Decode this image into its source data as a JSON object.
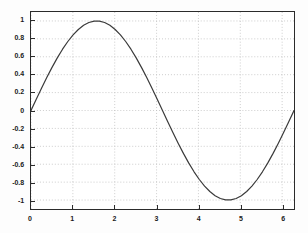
{
  "figure": {
    "background_color": "#fdfdfd",
    "axes_background_color": "#ffffff",
    "axes_border_color": "#2b2b2b",
    "grid_color": "#bfbfbf",
    "line_color": "#3a3a3a",
    "tick_label_color": "#1a1a1a"
  },
  "chart_data": {
    "type": "line",
    "title": "",
    "subtitle": "",
    "xlabel": "",
    "ylabel": "",
    "xlim": [
      0,
      6.2832
    ],
    "ylim": [
      -1.1,
      1.1
    ],
    "grid": true,
    "grid_style": "dotted",
    "legend": null,
    "legend_position": "none",
    "xticks": [
      0,
      1,
      2,
      3,
      4,
      5,
      6
    ],
    "xtick_labels": [
      "0",
      "1",
      "2",
      "3",
      "4",
      "5",
      "6"
    ],
    "yticks": [
      1,
      0.8,
      0.6,
      0.4,
      0.2,
      0,
      -0.2,
      -0.4,
      -0.6,
      -0.8,
      -1
    ],
    "ytick_labels": [
      "1",
      "0.8",
      "0.6",
      "0.4",
      "0.2",
      "0",
      "-0.2",
      "-0.4",
      "-0.6",
      "-0.8",
      "-1"
    ],
    "series": [
      {
        "name": "sin(x)",
        "color": "#3a3a3a",
        "line_width": 1.2,
        "x": [
          0,
          0.1257,
          0.2513,
          0.377,
          0.5027,
          0.6283,
          0.754,
          0.8796,
          1.0053,
          1.131,
          1.2566,
          1.3823,
          1.508,
          1.6336,
          1.7593,
          1.885,
          2.0106,
          2.1363,
          2.2619,
          2.3876,
          2.5133,
          2.6389,
          2.7646,
          2.8903,
          3.0159,
          3.1416,
          3.2673,
          3.3929,
          3.5186,
          3.6442,
          3.7699,
          3.8956,
          4.0212,
          4.1469,
          4.2726,
          4.3982,
          4.5239,
          4.6496,
          4.7752,
          4.9009,
          5.0265,
          5.1522,
          5.2779,
          5.4035,
          5.5292,
          5.6549,
          5.7805,
          5.9062,
          6.0319,
          6.1575,
          6.2832
        ],
        "y": [
          0,
          0.1253,
          0.2487,
          0.3681,
          0.4818,
          0.5878,
          0.6845,
          0.7705,
          0.8443,
          0.9048,
          0.9511,
          0.9823,
          0.998,
          0.998,
          0.9823,
          0.9511,
          0.9048,
          0.8443,
          0.7705,
          0.6845,
          0.5878,
          0.4818,
          0.3681,
          0.2487,
          0.1253,
          0,
          -0.1253,
          -0.2487,
          -0.3681,
          -0.4818,
          -0.5878,
          -0.6845,
          -0.7705,
          -0.8443,
          -0.9048,
          -0.9511,
          -0.9823,
          -0.998,
          -0.998,
          -0.9823,
          -0.9511,
          -0.9048,
          -0.8443,
          -0.7705,
          -0.6845,
          -0.5878,
          -0.4818,
          -0.3681,
          -0.2487,
          -0.1253,
          0
        ]
      }
    ],
    "annotations": []
  }
}
